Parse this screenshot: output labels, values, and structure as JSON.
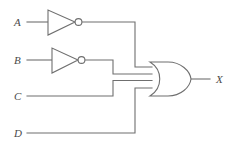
{
  "figure": {
    "kind": "logic-circuit-diagram",
    "background_color": "#ffffff",
    "line_color": "#6f6f6f",
    "label_color": "#4a4a4a"
  },
  "inputs": [
    {
      "id": "A",
      "label": "A",
      "label_x": 14,
      "label_y": 26,
      "wire_y": 22,
      "inverted": true
    },
    {
      "id": "B",
      "label": "B",
      "label_x": 14,
      "label_y": 64,
      "wire_y": 60,
      "inverted": true
    },
    {
      "id": "C",
      "label": "C",
      "label_x": 14,
      "label_y": 100,
      "wire_y": 96,
      "inverted": false
    },
    {
      "id": "D",
      "label": "D",
      "label_x": 14,
      "label_y": 137,
      "wire_y": 133,
      "inverted": false
    }
  ],
  "output": {
    "id": "X",
    "label": "X",
    "label_x": 216,
    "label_y": 82,
    "wire_y": 79
  },
  "gates": [
    {
      "id": "inv-a",
      "type": "NOT",
      "label": "inverter-a",
      "input_signal": "A",
      "triangle": {
        "x1": 48,
        "y1": 10,
        "x2": 48,
        "y2": 35,
        "apex_x": 75,
        "apex_y": 22
      },
      "bubble": {
        "cx": 78.5,
        "cy": 22,
        "r": 3.4
      }
    },
    {
      "id": "inv-b",
      "type": "NOT",
      "label": "inverter-b",
      "input_signal": "B",
      "triangle": {
        "x1": 52,
        "y1": 48,
        "x2": 52,
        "y2": 73,
        "apex_x": 78,
        "apex_y": 60
      },
      "bubble": {
        "cx": 81.5,
        "cy": 60,
        "r": 3.4
      }
    },
    {
      "id": "or-1",
      "type": "OR",
      "label": "or-gate",
      "inputs": [
        "A'",
        "B'",
        "C",
        "D"
      ],
      "output_signal": "X",
      "left_x": 150,
      "right_x": 191,
      "top_y": 62,
      "bottom_y": 96,
      "input_stub_y": [
        67,
        74,
        80.5,
        88
      ]
    }
  ],
  "wires": [
    {
      "name": "wire-a-input",
      "path": "M 27 22 L 48 22"
    },
    {
      "name": "wire-a-bubble-to-corner",
      "path": "M 82 22 L 135 22 L 135 67 L 152 67"
    },
    {
      "name": "wire-b-input",
      "path": "M 27 60 L 52 60"
    },
    {
      "name": "wire-b-bubble-to-corner",
      "path": "M 85 60 L 113 60 L 113 74 L 152 74"
    },
    {
      "name": "wire-c-input",
      "path": "M 27 96 L 113 96 L 113 80.5 L 152 80.5"
    },
    {
      "name": "wire-d-input",
      "path": "M 27 133 L 135 133 L 135 88 L 152 88"
    },
    {
      "name": "wire-x-output",
      "path": "M 191 79 L 210 79"
    }
  ]
}
